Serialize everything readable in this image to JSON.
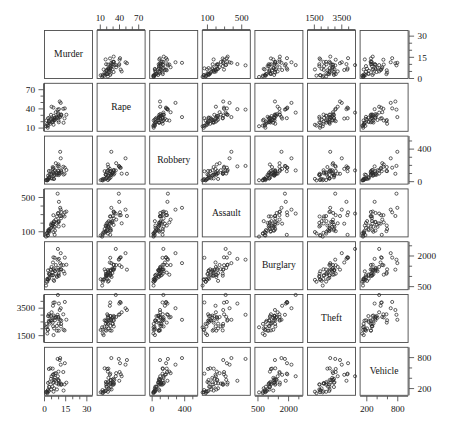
{
  "figure": {
    "type": "scatterplot-matrix",
    "title": "",
    "background_color": "#ffffff",
    "frame_color": "#4a4a4a",
    "point_color": "#2b2b2b",
    "n_variables": 7,
    "n_observations": 50,
    "point_marker": "open-circle"
  },
  "chart_data": {
    "type": "scatter",
    "subtype": "scatterplot-matrix",
    "title": "",
    "xlabel": "",
    "ylabel": "",
    "grid": false,
    "legend": "none",
    "variables": [
      "Murder",
      "Rape",
      "Robbery",
      "Assault",
      "Burglary",
      "Theft",
      "Vehicle"
    ],
    "axes": [
      {
        "name": "Murder",
        "index": 0,
        "lim": [
          0,
          34
        ],
        "tick_values": [
          0,
          15,
          30
        ],
        "tick_labels": [
          "0",
          "15",
          "30"
        ],
        "minor_ticks": [
          0,
          5,
          10,
          15,
          20,
          25,
          30
        ],
        "label_sides": [
          "bottom",
          "right"
        ]
      },
      {
        "name": "Rape",
        "index": 1,
        "lim": [
          5,
          80
        ],
        "tick_values": [
          10,
          40,
          70
        ],
        "tick_labels": [
          "10",
          "40",
          "70"
        ],
        "minor_ticks": [
          10,
          20,
          30,
          40,
          50,
          60,
          70
        ],
        "label_sides": [
          "top",
          "left"
        ]
      },
      {
        "name": "Robbery",
        "index": 2,
        "lim": [
          -30,
          560
        ],
        "tick_values": [
          0,
          400
        ],
        "tick_labels": [
          "0",
          "400"
        ],
        "minor_ticks": [
          0,
          100,
          200,
          300,
          400,
          500
        ],
        "label_sides": [
          "bottom",
          "right"
        ]
      },
      {
        "name": "Assault",
        "index": 3,
        "lim": [
          40,
          600
        ],
        "tick_values": [
          100,
          500
        ],
        "tick_labels": [
          "100",
          "500"
        ],
        "minor_ticks": [
          100,
          200,
          300,
          400,
          500
        ],
        "label_sides": [
          "top",
          "left"
        ]
      },
      {
        "name": "Burglary",
        "index": 4,
        "lim": [
          350,
          2700
        ],
        "tick_values": [
          500,
          2000
        ],
        "tick_labels": [
          "500",
          "2000"
        ],
        "minor_ticks": [
          500,
          1000,
          1500,
          2000,
          2500
        ],
        "label_sides": [
          "bottom",
          "right"
        ]
      },
      {
        "name": "Theft",
        "index": 5,
        "lim": [
          1000,
          4500
        ],
        "tick_values": [
          1500,
          3500
        ],
        "tick_labels": [
          "1500",
          "3500"
        ],
        "minor_ticks": [
          1500,
          2000,
          2500,
          3000,
          3500,
          4000
        ],
        "label_sides": [
          "top",
          "left"
        ]
      },
      {
        "name": "Vehicle",
        "index": 6,
        "lim": [
          70,
          1000
        ],
        "tick_values": [
          200,
          800
        ],
        "tick_labels": [
          "200",
          "800"
        ],
        "minor_ticks": [
          200,
          400,
          600,
          800
        ],
        "label_sides": [
          "bottom",
          "right"
        ]
      }
    ],
    "observations": [
      {
        "Murder": 14.2,
        "Rape": 25.2,
        "Robbery": 96.8,
        "Assault": 278.3,
        "Burglary": 1135.5,
        "Theft": 1881.9,
        "Vehicle": 280.7
      },
      {
        "Murder": 10.8,
        "Rape": 51.6,
        "Robbery": 96.8,
        "Assault": 284.0,
        "Burglary": 1331.7,
        "Theft": 3369.8,
        "Vehicle": 753.3
      },
      {
        "Murder": 9.5,
        "Rape": 34.2,
        "Robbery": 138.2,
        "Assault": 312.3,
        "Burglary": 2346.1,
        "Theft": 4467.4,
        "Vehicle": 439.5
      },
      {
        "Murder": 8.8,
        "Rape": 27.6,
        "Robbery": 83.2,
        "Assault": 203.4,
        "Burglary": 972.6,
        "Theft": 1862.1,
        "Vehicle": 183.4
      },
      {
        "Murder": 11.5,
        "Rape": 49.4,
        "Robbery": 287.0,
        "Assault": 358.0,
        "Burglary": 2139.4,
        "Theft": 3499.8,
        "Vehicle": 663.5
      },
      {
        "Murder": 6.3,
        "Rape": 42.0,
        "Robbery": 170.7,
        "Assault": 292.9,
        "Burglary": 1935.2,
        "Theft": 3903.2,
        "Vehicle": 477.1
      },
      {
        "Murder": 4.2,
        "Rape": 16.8,
        "Robbery": 129.5,
        "Assault": 131.8,
        "Burglary": 1346.0,
        "Theft": 2620.7,
        "Vehicle": 593.2
      },
      {
        "Murder": 6.0,
        "Rape": 24.9,
        "Robbery": 157.0,
        "Assault": 194.2,
        "Burglary": 1682.6,
        "Theft": 3678.4,
        "Vehicle": 467.0
      },
      {
        "Murder": 10.2,
        "Rape": 39.6,
        "Robbery": 187.9,
        "Assault": 449.1,
        "Burglary": 1859.9,
        "Theft": 3840.5,
        "Vehicle": 351.4
      },
      {
        "Murder": 11.7,
        "Rape": 31.1,
        "Robbery": 140.5,
        "Assault": 256.5,
        "Burglary": 1351.1,
        "Theft": 2170.2,
        "Vehicle": 297.9
      },
      {
        "Murder": 7.2,
        "Rape": 25.5,
        "Robbery": 128.0,
        "Assault": 64.1,
        "Burglary": 1911.5,
        "Theft": 3920.4,
        "Vehicle": 489.4
      },
      {
        "Murder": 5.5,
        "Rape": 19.4,
        "Robbery": 39.6,
        "Assault": 172.5,
        "Burglary": 1050.8,
        "Theft": 2599.6,
        "Vehicle": 237.6
      },
      {
        "Murder": 9.9,
        "Rape": 21.8,
        "Robbery": 211.3,
        "Assault": 209.0,
        "Burglary": 1085.0,
        "Theft": 2828.5,
        "Vehicle": 528.6
      },
      {
        "Murder": 7.4,
        "Rape": 26.5,
        "Robbery": 82.5,
        "Assault": 113.2,
        "Burglary": 1270.4,
        "Theft": 2616.8,
        "Vehicle": 366.9
      },
      {
        "Murder": 2.3,
        "Rape": 10.6,
        "Robbery": 19.1,
        "Assault": 56.6,
        "Burglary": 862.9,
        "Theft": 1913.4,
        "Vehicle": 130.0
      },
      {
        "Murder": 6.6,
        "Rape": 22.0,
        "Robbery": 76.3,
        "Assault": 157.9,
        "Burglary": 1314.0,
        "Theft": 2965.2,
        "Vehicle": 324.8
      },
      {
        "Murder": 10.1,
        "Rape": 19.1,
        "Robbery": 80.5,
        "Assault": 161.2,
        "Burglary": 1022.6,
        "Theft": 1862.2,
        "Vehicle": 279.0
      },
      {
        "Murder": 15.5,
        "Rape": 30.9,
        "Robbery": 142.9,
        "Assault": 335.5,
        "Burglary": 1572.6,
        "Theft": 2661.3,
        "Vehicle": 314.8
      },
      {
        "Murder": 2.4,
        "Rape": 13.5,
        "Robbery": 32.0,
        "Assault": 61.5,
        "Burglary": 832.8,
        "Theft": 1938.4,
        "Vehicle": 171.9
      },
      {
        "Murder": 8.0,
        "Rape": 34.8,
        "Robbery": 227.0,
        "Assault": 241.9,
        "Burglary": 1558.7,
        "Theft": 2861.1,
        "Vehicle": 498.9
      },
      {
        "Murder": 3.1,
        "Rape": 20.8,
        "Robbery": 131.1,
        "Assault": 107.2,
        "Burglary": 1134.8,
        "Theft": 3058.3,
        "Vehicle": 580.2
      },
      {
        "Murder": 9.3,
        "Rape": 38.9,
        "Robbery": 193.7,
        "Assault": 544.3,
        "Burglary": 1820.2,
        "Theft": 3020.4,
        "Vehicle": 774.6
      },
      {
        "Murder": 2.5,
        "Rape": 25.5,
        "Robbery": 73.7,
        "Assault": 115.8,
        "Burglary": 1293.7,
        "Theft": 2927.0,
        "Vehicle": 310.2
      },
      {
        "Murder": 13.5,
        "Rape": 18.3,
        "Robbery": 87.2,
        "Assault": 172.1,
        "Burglary": 1248.3,
        "Theft": 1929.5,
        "Vehicle": 161.9
      },
      {
        "Murder": 9.9,
        "Rape": 26.2,
        "Robbery": 129.7,
        "Assault": 215.2,
        "Burglary": 1323.4,
        "Theft": 2724.0,
        "Vehicle": 362.5
      },
      {
        "Murder": 4.7,
        "Rape": 24.5,
        "Robbery": 40.8,
        "Assault": 145.6,
        "Burglary": 1056.4,
        "Theft": 2616.5,
        "Vehicle": 182.2
      },
      {
        "Murder": 3.1,
        "Rape": 18.5,
        "Robbery": 39.1,
        "Assault": 109.8,
        "Burglary": 928.1,
        "Theft": 2589.1,
        "Vehicle": 154.0
      },
      {
        "Murder": 14.4,
        "Rape": 40.8,
        "Robbery": 171.6,
        "Assault": 326.6,
        "Burglary": 1920.8,
        "Theft": 3957.0,
        "Vehicle": 691.6
      },
      {
        "Murder": 1.9,
        "Rape": 16.5,
        "Robbery": 27.6,
        "Assault": 87.8,
        "Burglary": 876.1,
        "Theft": 2161.1,
        "Vehicle": 146.0
      },
      {
        "Murder": 5.8,
        "Rape": 22.6,
        "Robbery": 179.7,
        "Assault": 172.6,
        "Burglary": 1187.4,
        "Theft": 2450.7,
        "Vehicle": 586.8
      },
      {
        "Murder": 9.7,
        "Rape": 31.9,
        "Robbery": 100.3,
        "Assault": 318.9,
        "Burglary": 1416.1,
        "Theft": 2871.4,
        "Vehicle": 369.3
      },
      {
        "Murder": 11.1,
        "Rape": 27.2,
        "Robbery": 367.0,
        "Assault": 379.3,
        "Burglary": 1651.0,
        "Theft": 2655.9,
        "Vehicle": 791.6
      },
      {
        "Murder": 11.8,
        "Rape": 29.6,
        "Robbery": 113.9,
        "Assault": 283.2,
        "Burglary": 1340.5,
        "Theft": 2356.5,
        "Vehicle": 275.5
      },
      {
        "Murder": 1.1,
        "Rape": 12.9,
        "Robbery": 17.4,
        "Assault": 43.7,
        "Burglary": 552.9,
        "Theft": 2110.4,
        "Vehicle": 126.1
      },
      {
        "Murder": 7.4,
        "Rape": 22.7,
        "Robbery": 140.0,
        "Assault": 157.1,
        "Burglary": 1253.1,
        "Theft": 2801.6,
        "Vehicle": 407.5
      },
      {
        "Murder": 6.6,
        "Rape": 29.2,
        "Robbery": 99.0,
        "Assault": 211.3,
        "Burglary": 1388.6,
        "Theft": 2828.5,
        "Vehicle": 374.0
      },
      {
        "Murder": 4.6,
        "Rape": 30.8,
        "Robbery": 86.5,
        "Assault": 180.0,
        "Burglary": 1318.1,
        "Theft": 2934.6,
        "Vehicle": 390.2
      },
      {
        "Murder": 6.1,
        "Rape": 20.0,
        "Robbery": 116.2,
        "Assault": 196.9,
        "Burglary": 1065.5,
        "Theft": 2183.9,
        "Vehicle": 307.2
      },
      {
        "Murder": 3.6,
        "Rape": 18.7,
        "Robbery": 87.9,
        "Assault": 100.0,
        "Burglary": 1114.4,
        "Theft": 2380.1,
        "Vehicle": 328.3
      },
      {
        "Murder": 11.9,
        "Rape": 31.0,
        "Robbery": 128.1,
        "Assault": 330.8,
        "Burglary": 1561.6,
        "Theft": 2595.9,
        "Vehicle": 279.7
      },
      {
        "Murder": 2.0,
        "Rape": 13.9,
        "Robbery": 15.7,
        "Assault": 80.6,
        "Burglary": 738.3,
        "Theft": 1653.2,
        "Vehicle": 111.4
      },
      {
        "Murder": 10.1,
        "Rape": 28.8,
        "Robbery": 104.4,
        "Assault": 224.4,
        "Burglary": 1162.2,
        "Theft": 2380.1,
        "Vehicle": 301.4
      },
      {
        "Murder": 13.3,
        "Rape": 40.1,
        "Robbery": 183.4,
        "Assault": 293.9,
        "Burglary": 1551.7,
        "Theft": 3055.6,
        "Vehicle": 521.0
      },
      {
        "Murder": 3.5,
        "Rape": 26.2,
        "Robbery": 53.0,
        "Assault": 132.4,
        "Burglary": 1093.0,
        "Theft": 2927.6,
        "Vehicle": 230.5
      },
      {
        "Murder": 1.4,
        "Rape": 21.9,
        "Robbery": 19.4,
        "Assault": 78.9,
        "Burglary": 746.1,
        "Theft": 2358.3,
        "Vehicle": 138.0
      },
      {
        "Murder": 8.8,
        "Rape": 25.9,
        "Robbery": 102.4,
        "Assault": 279.2,
        "Burglary": 1035.0,
        "Theft": 2205.2,
        "Vehicle": 299.3
      },
      {
        "Murder": 5.0,
        "Rape": 43.4,
        "Robbery": 98.6,
        "Assault": 198.5,
        "Burglary": 1464.0,
        "Theft": 3202.6,
        "Vehicle": 438.7
      },
      {
        "Murder": 6.4,
        "Rape": 15.2,
        "Robbery": 34.2,
        "Assault": 96.5,
        "Burglary": 831.8,
        "Theft": 1542.3,
        "Vehicle": 140.5
      },
      {
        "Murder": 3.2,
        "Rape": 20.4,
        "Robbery": 53.1,
        "Assault": 119.3,
        "Burglary": 888.4,
        "Theft": 2500.7,
        "Vehicle": 236.2
      },
      {
        "Murder": 6.8,
        "Rape": 23.2,
        "Robbery": 33.3,
        "Assault": 223.9,
        "Burglary": 781.2,
        "Theft": 2026.3,
        "Vehicle": 205.4
      }
    ]
  }
}
